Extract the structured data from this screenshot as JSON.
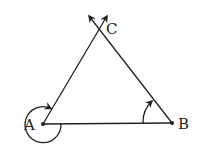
{
  "diagram": {
    "type": "geometry-triangle",
    "points": [
      {
        "id": "A",
        "label": "A",
        "x": 43,
        "y": 124
      },
      {
        "id": "B",
        "label": "B",
        "x": 172,
        "y": 123
      },
      {
        "id": "C",
        "label": "C",
        "x": 99,
        "y": 28
      }
    ],
    "rays": [
      {
        "from": "A",
        "through": "C",
        "arrow": true
      },
      {
        "from": "B",
        "through": "C",
        "arrow": true
      }
    ],
    "segments": [
      {
        "from": "A",
        "to": "B"
      }
    ],
    "angle_marks": [
      {
        "at": "A",
        "kind": "reflex-exterior",
        "direction": "arrowed arc from AC around to AB"
      },
      {
        "at": "B",
        "kind": "interior",
        "direction": "arrowed arc from BA toward BC"
      }
    ],
    "colors": {
      "stroke": "#222222",
      "background": "#ffffff"
    }
  }
}
